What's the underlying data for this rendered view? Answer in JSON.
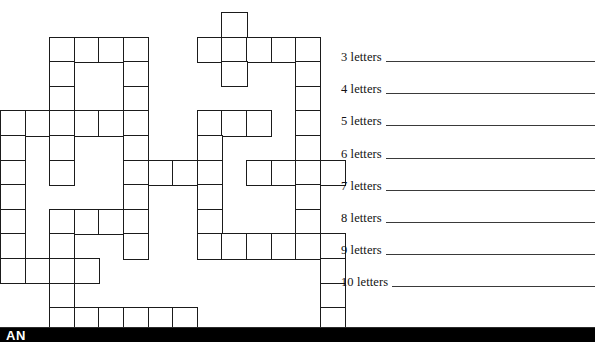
{
  "page": {
    "background_color": "#ffffff",
    "ink_color": "#1b1b1b",
    "width": 595,
    "height": 342
  },
  "grid": {
    "name": "criss-cross-puzzle-grid",
    "columns": 14,
    "rows": 13,
    "cell_size": 24.6,
    "origin_x": 0,
    "origin_y": 12,
    "border_color": "#1b1b1b",
    "fill_color": "#ffffff",
    "cells": [
      [
        9,
        0
      ],
      [
        2,
        1
      ],
      [
        3,
        1
      ],
      [
        4,
        1
      ],
      [
        5,
        1
      ],
      [
        8,
        1
      ],
      [
        9,
        1
      ],
      [
        10,
        1
      ],
      [
        11,
        1
      ],
      [
        12,
        1
      ],
      [
        2,
        2
      ],
      [
        5,
        2
      ],
      [
        9,
        2
      ],
      [
        12,
        2
      ],
      [
        2,
        3
      ],
      [
        5,
        3
      ],
      [
        12,
        3
      ],
      [
        0,
        4
      ],
      [
        1,
        4
      ],
      [
        2,
        4
      ],
      [
        3,
        4
      ],
      [
        4,
        4
      ],
      [
        5,
        4
      ],
      [
        8,
        4
      ],
      [
        9,
        4
      ],
      [
        10,
        4
      ],
      [
        12,
        4
      ],
      [
        0,
        5
      ],
      [
        2,
        5
      ],
      [
        5,
        5
      ],
      [
        8,
        5
      ],
      [
        12,
        5
      ],
      [
        0,
        6
      ],
      [
        2,
        6
      ],
      [
        5,
        6
      ],
      [
        6,
        6
      ],
      [
        7,
        6
      ],
      [
        8,
        6
      ],
      [
        10,
        6
      ],
      [
        11,
        6
      ],
      [
        12,
        6
      ],
      [
        13,
        6
      ],
      [
        0,
        7
      ],
      [
        5,
        7
      ],
      [
        8,
        7
      ],
      [
        12,
        7
      ],
      [
        0,
        8
      ],
      [
        2,
        8
      ],
      [
        3,
        8
      ],
      [
        4,
        8
      ],
      [
        5,
        8
      ],
      [
        8,
        8
      ],
      [
        12,
        8
      ],
      [
        0,
        9
      ],
      [
        2,
        9
      ],
      [
        5,
        9
      ],
      [
        8,
        9
      ],
      [
        9,
        9
      ],
      [
        10,
        9
      ],
      [
        11,
        9
      ],
      [
        12,
        9
      ],
      [
        13,
        9
      ],
      [
        0,
        10
      ],
      [
        1,
        10
      ],
      [
        2,
        10
      ],
      [
        3,
        10
      ],
      [
        13,
        10
      ],
      [
        2,
        11
      ],
      [
        13,
        11
      ],
      [
        2,
        12
      ],
      [
        3,
        12
      ],
      [
        4,
        12
      ],
      [
        5,
        12
      ],
      [
        6,
        12
      ],
      [
        7,
        12
      ],
      [
        13,
        12
      ]
    ]
  },
  "clues": {
    "name": "word-length-answer-lines",
    "rule_color": "#3a3a3a",
    "items": [
      {
        "label": "3 letters",
        "answer": ""
      },
      {
        "label": "4 letters",
        "answer": ""
      },
      {
        "label": "5 letters",
        "answer": ""
      },
      {
        "label": "6 letters",
        "answer": ""
      },
      {
        "label": "7 letters",
        "answer": ""
      },
      {
        "label": "8 letters",
        "answer": ""
      },
      {
        "label": "9 letters",
        "answer": ""
      },
      {
        "label": "10 letters",
        "answer": ""
      }
    ]
  },
  "footer": {
    "bar_color": "#000000",
    "text": "AN",
    "text_color": "#ffffff"
  }
}
